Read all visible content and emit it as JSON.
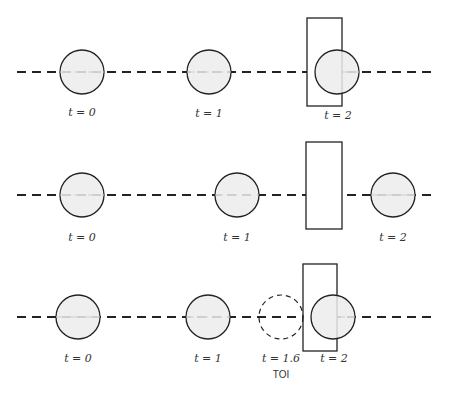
{
  "diagram": {
    "rows": [
      {
        "name": "row-1-discrete-overlap",
        "line_y": 72,
        "line_x": [
          17,
          436
        ],
        "wall": {
          "x": 307,
          "y": 18,
          "w": 35,
          "h": 88
        },
        "balls": [
          {
            "cx": 82,
            "cy": 72,
            "r": 22,
            "label": "t = 0",
            "style": "solid"
          },
          {
            "cx": 209,
            "cy": 72,
            "r": 22,
            "label": "t = 1",
            "style": "solid"
          },
          {
            "cx": 337,
            "cy": 72,
            "r": 22,
            "label": "t = 2",
            "style": "solid"
          }
        ],
        "label_y": 116
      },
      {
        "name": "row-2-tunneling",
        "line_y": 195,
        "line_x": [
          17,
          436
        ],
        "wall": {
          "x": 306,
          "y": 142,
          "w": 36,
          "h": 87
        },
        "balls": [
          {
            "cx": 82,
            "cy": 195,
            "r": 22,
            "label": "t = 0",
            "style": "solid"
          },
          {
            "cx": 237,
            "cy": 195,
            "r": 22,
            "label": "t = 1",
            "style": "solid"
          },
          {
            "cx": 393,
            "cy": 195,
            "r": 22,
            "label": "t = 2",
            "style": "solid"
          }
        ],
        "label_y": 241
      },
      {
        "name": "row-3-time-of-impact",
        "line_y": 317,
        "line_x": [
          17,
          436
        ],
        "wall": {
          "x": 303,
          "y": 264,
          "w": 34,
          "h": 87
        },
        "balls": [
          {
            "cx": 78,
            "cy": 317,
            "r": 22,
            "label": "t = 0",
            "style": "solid"
          },
          {
            "cx": 208,
            "cy": 317,
            "r": 22,
            "label": "t = 1",
            "style": "solid"
          },
          {
            "cx": 281,
            "cy": 317,
            "r": 22,
            "label": "t = 1.6",
            "style": "dashed",
            "sublabel": "TOI"
          },
          {
            "cx": 333,
            "cy": 317,
            "r": 22,
            "label": "t = 2",
            "style": "solid"
          }
        ],
        "label_y": 362
      }
    ]
  },
  "labels": {
    "r1_t0": "t = 0",
    "r1_t1": "t = 1",
    "r1_t2": "t = 2",
    "r2_t0": "t = 0",
    "r2_t1": "t = 1",
    "r2_t2": "t = 2",
    "r3_t0": "t = 0",
    "r3_t1": "t = 1",
    "r3_t16": "t = 1.6",
    "r3_toi": "TOI",
    "r3_t2": "t = 2"
  },
  "colors": {
    "stroke": "#222222",
    "ball_fill": "#ececec",
    "background": "#ffffff"
  }
}
